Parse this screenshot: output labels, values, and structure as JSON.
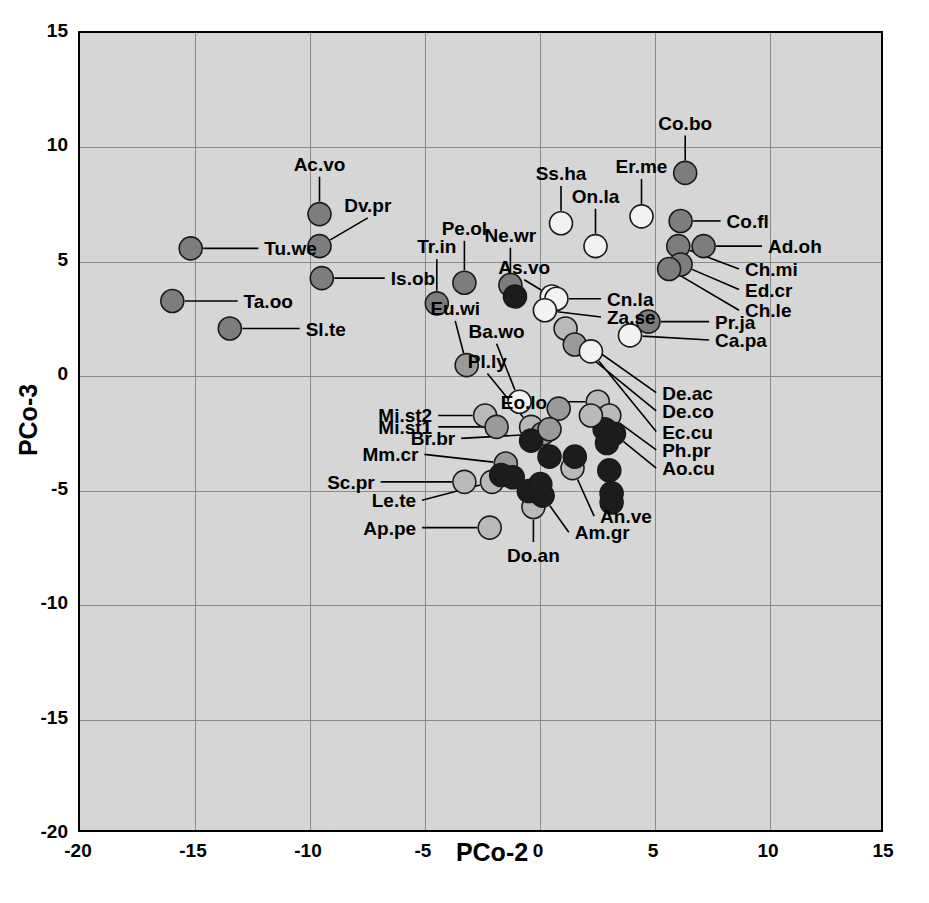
{
  "chart_data": {
    "type": "scatter",
    "title": "",
    "xlabel": "PCo-2",
    "ylabel": "PCo-3",
    "xlim": [
      -20,
      15
    ],
    "ylim": [
      -20,
      15
    ],
    "xticks": [
      -20,
      -15,
      -10,
      -5,
      0,
      5,
      10,
      15
    ],
    "yticks": [
      -20,
      -15,
      -10,
      -5,
      0,
      5,
      10,
      15
    ],
    "xtick_labels": [
      "-20",
      "-15",
      "-10",
      "-5",
      "0",
      "5",
      "10",
      "15"
    ],
    "ytick_labels": [
      "-20",
      "-15",
      "-10",
      "-5",
      "0",
      "5",
      "10",
      "15"
    ],
    "grid": true,
    "legend": "none",
    "plot_background": "#d6d6d6",
    "grid_color": "#8a8a8a",
    "marker_fills": {
      "open": "#f2f2f2",
      "light": "#b9b9b9",
      "mid": "#9a9a9a",
      "gray": "#7d7d7d",
      "dark": "#1c1c1c"
    },
    "points": [
      {
        "label": "Tu.we",
        "x": -15.1,
        "y": 5.5,
        "fill": "gray",
        "label_x": -11.9,
        "label_y": 5.5,
        "anchor": "start",
        "leader": true
      },
      {
        "label": "Ta.oo",
        "x": -15.9,
        "y": 3.2,
        "fill": "gray",
        "label_x": -12.8,
        "label_y": 3.2,
        "anchor": "start",
        "leader": true
      },
      {
        "label": "Sl.te",
        "x": -13.4,
        "y": 2.0,
        "fill": "gray",
        "label_x": -10.1,
        "label_y": 2.0,
        "anchor": "start",
        "leader": true
      },
      {
        "label": "Ac.vo",
        "x": -9.5,
        "y": 7.0,
        "fill": "gray",
        "label_x": -9.5,
        "label_y": 9.2,
        "anchor": "mid",
        "leader": true
      },
      {
        "label": "Dv.pr",
        "x": -9.5,
        "y": 5.6,
        "fill": "gray",
        "label_x": -7.4,
        "label_y": 7.4,
        "anchor": "mid",
        "leader": true
      },
      {
        "label": "Is.ob",
        "x": -9.4,
        "y": 4.2,
        "fill": "gray",
        "label_x": -6.4,
        "label_y": 4.2,
        "anchor": "start",
        "leader": true
      },
      {
        "label": "Tr.in",
        "x": -4.4,
        "y": 3.1,
        "fill": "gray",
        "label_x": -4.4,
        "label_y": 5.6,
        "anchor": "mid",
        "leader": true
      },
      {
        "label": "Pe.ol",
        "x": -3.2,
        "y": 4.0,
        "fill": "gray",
        "label_x": -3.2,
        "label_y": 6.4,
        "anchor": "mid",
        "leader": true
      },
      {
        "label": "Eu.wi",
        "x": -3.1,
        "y": 0.4,
        "fill": "mid",
        "label_x": -3.6,
        "label_y": 2.9,
        "anchor": "mid",
        "leader": true
      },
      {
        "label": "Ne.wr",
        "x": -1.2,
        "y": 3.9,
        "fill": "gray",
        "label_x": -1.2,
        "label_y": 6.1,
        "anchor": "mid",
        "leader": true
      },
      {
        "label": "Ne.wr2",
        "x": -1.0,
        "y": 3.4,
        "fill": "dark",
        "label_x": null,
        "label_y": null,
        "anchor": "mid",
        "leader": false
      },
      {
        "label": "Ss.ha",
        "x": 1.0,
        "y": 6.6,
        "fill": "open",
        "label_x": 1.0,
        "label_y": 8.8,
        "anchor": "mid",
        "leader": true
      },
      {
        "label": "On.la",
        "x": 2.5,
        "y": 5.6,
        "fill": "open",
        "label_x": 2.5,
        "label_y": 7.8,
        "anchor": "mid",
        "leader": true
      },
      {
        "label": "Er.me",
        "x": 4.5,
        "y": 6.9,
        "fill": "open",
        "label_x": 4.5,
        "label_y": 9.1,
        "anchor": "mid",
        "leader": true
      },
      {
        "label": "Co.bo",
        "x": 6.4,
        "y": 8.8,
        "fill": "gray",
        "label_x": 6.4,
        "label_y": 11.0,
        "anchor": "mid",
        "leader": true
      },
      {
        "label": "Co.fl",
        "x": 6.2,
        "y": 6.7,
        "fill": "gray",
        "label_x": 8.2,
        "label_y": 6.7,
        "anchor": "start",
        "leader": true
      },
      {
        "label": "Ad.oh",
        "x": 7.2,
        "y": 5.6,
        "fill": "gray",
        "label_x": 10.0,
        "label_y": 5.6,
        "anchor": "start",
        "leader": true
      },
      {
        "label": "Ch.mi",
        "x": 6.1,
        "y": 5.6,
        "fill": "gray",
        "label_x": 9.0,
        "label_y": 4.6,
        "anchor": "start",
        "leader": true
      },
      {
        "label": "Ed.cr",
        "x": 6.2,
        "y": 4.8,
        "fill": "gray",
        "label_x": 9.0,
        "label_y": 3.7,
        "anchor": "start",
        "leader": true
      },
      {
        "label": "Ch.le",
        "x": 5.7,
        "y": 4.6,
        "fill": "gray",
        "label_x": 9.0,
        "label_y": 2.8,
        "anchor": "start",
        "leader": true
      },
      {
        "label": "As.vo",
        "x": 0.6,
        "y": 3.4,
        "fill": "open",
        "label_x": -0.6,
        "label_y": 4.7,
        "anchor": "mid",
        "leader": true
      },
      {
        "label": "Cn.la",
        "x": 0.8,
        "y": 3.3,
        "fill": "open",
        "label_x": 3.0,
        "label_y": 3.3,
        "anchor": "start",
        "leader": true
      },
      {
        "label": "Za.se",
        "x": 0.3,
        "y": 2.8,
        "fill": "open",
        "label_x": 3.0,
        "label_y": 2.5,
        "anchor": "start",
        "leader": true
      },
      {
        "label": "Pr.ja",
        "x": 4.8,
        "y": 2.3,
        "fill": "gray",
        "label_x": 7.7,
        "label_y": 2.3,
        "anchor": "start",
        "leader": true
      },
      {
        "label": "Ca.pa",
        "x": 4.0,
        "y": 1.7,
        "fill": "open",
        "label_x": 7.7,
        "label_y": 1.5,
        "anchor": "start",
        "leader": true
      },
      {
        "label": "Ba.wo",
        "x": -0.8,
        "y": -1.2,
        "fill": "open",
        "label_x": -1.8,
        "label_y": 1.9,
        "anchor": "mid",
        "leader": true
      },
      {
        "label": "Pl.ly",
        "x": -0.3,
        "y": -2.3,
        "fill": "light",
        "label_x": -2.2,
        "label_y": 0.6,
        "anchor": "mid",
        "leader": true
      },
      {
        "label": "De.ac",
        "x": 1.2,
        "y": 2.0,
        "fill": "light",
        "label_x": 5.4,
        "label_y": -0.8,
        "anchor": "start",
        "leader": true
      },
      {
        "label": "De.co",
        "x": 1.6,
        "y": 1.3,
        "fill": "mid",
        "label_x": 5.4,
        "label_y": -1.6,
        "anchor": "start",
        "leader": true
      },
      {
        "label": "Ec.cu",
        "x": 2.3,
        "y": 1.0,
        "fill": "open",
        "label_x": 5.4,
        "label_y": -2.5,
        "anchor": "start",
        "leader": true
      },
      {
        "label": "Eo.lo",
        "x": 2.6,
        "y": -1.2,
        "fill": "light",
        "label_x": 0.4,
        "label_y": -1.2,
        "anchor": "end",
        "leader": true
      },
      {
        "label": "Ph.pr",
        "x": 3.1,
        "y": -1.8,
        "fill": "light",
        "label_x": 5.4,
        "label_y": -3.3,
        "anchor": "start",
        "leader": true
      },
      {
        "label": "Ao.cu",
        "x": 3.3,
        "y": -2.6,
        "fill": "dark",
        "label_x": 5.4,
        "label_y": -4.1,
        "anchor": "start",
        "leader": true
      },
      {
        "label": "Mi.st2",
        "x": -2.3,
        "y": -1.8,
        "fill": "light",
        "label_x": -4.6,
        "label_y": -1.8,
        "anchor": "end",
        "leader": true
      },
      {
        "label": "Mi.st1",
        "x": -1.8,
        "y": -2.3,
        "fill": "mid",
        "label_x": -4.6,
        "label_y": -2.3,
        "anchor": "end",
        "leader": true
      },
      {
        "label": "Br.br",
        "x": 0.2,
        "y": -2.6,
        "fill": "mid",
        "label_x": -3.6,
        "label_y": -2.8,
        "anchor": "end",
        "leader": true
      },
      {
        "label": "Mm.cr",
        "x": -1.4,
        "y": -3.9,
        "fill": "mid",
        "label_x": -5.2,
        "label_y": -3.5,
        "anchor": "end",
        "leader": true
      },
      {
        "label": "Sc.pr",
        "x": -3.2,
        "y": -4.7,
        "fill": "light",
        "label_x": -7.1,
        "label_y": -4.7,
        "anchor": "end",
        "leader": true
      },
      {
        "label": "Le.te",
        "x": -2.0,
        "y": -4.7,
        "fill": "light",
        "label_x": -5.3,
        "label_y": -5.5,
        "anchor": "end",
        "leader": true
      },
      {
        "label": "Ap.pe",
        "x": -2.1,
        "y": -6.7,
        "fill": "light",
        "label_x": -5.3,
        "label_y": -6.7,
        "anchor": "end",
        "leader": true
      },
      {
        "label": "Do.an",
        "x": -0.2,
        "y": -5.8,
        "fill": "light",
        "label_x": -0.2,
        "label_y": -7.9,
        "anchor": "mid",
        "leader": true
      },
      {
        "label": "Am.gr",
        "x": 0.2,
        "y": -5.3,
        "fill": "dark",
        "label_x": 1.6,
        "label_y": -6.9,
        "anchor": "start",
        "leader": true
      },
      {
        "label": "An.ve",
        "x": 1.5,
        "y": -4.1,
        "fill": "light",
        "label_x": 2.7,
        "label_y": -6.2,
        "anchor": "start",
        "leader": true
      },
      {
        "label": "p01",
        "x": -0.3,
        "y": -2.9,
        "fill": "dark",
        "label_x": null,
        "label_y": null,
        "anchor": "mid",
        "leader": false
      },
      {
        "label": "p02",
        "x": -1.6,
        "y": -4.4,
        "fill": "dark",
        "label_x": null,
        "label_y": null,
        "anchor": "mid",
        "leader": false
      },
      {
        "label": "p03",
        "x": -1.1,
        "y": -4.5,
        "fill": "dark",
        "label_x": null,
        "label_y": null,
        "anchor": "mid",
        "leader": false
      },
      {
        "label": "p04",
        "x": 0.5,
        "y": -3.6,
        "fill": "dark",
        "label_x": null,
        "label_y": null,
        "anchor": "mid",
        "leader": false
      },
      {
        "label": "p05",
        "x": 1.6,
        "y": -3.6,
        "fill": "dark",
        "label_x": null,
        "label_y": null,
        "anchor": "mid",
        "leader": false
      },
      {
        "label": "p06",
        "x": -0.4,
        "y": -5.1,
        "fill": "dark",
        "label_x": null,
        "label_y": null,
        "anchor": "mid",
        "leader": false
      },
      {
        "label": "p07",
        "x": 0.1,
        "y": -4.8,
        "fill": "dark",
        "label_x": null,
        "label_y": null,
        "anchor": "mid",
        "leader": false
      },
      {
        "label": "p08",
        "x": 2.9,
        "y": -2.4,
        "fill": "dark",
        "label_x": null,
        "label_y": null,
        "anchor": "mid",
        "leader": false
      },
      {
        "label": "p09",
        "x": 3.0,
        "y": -3.0,
        "fill": "dark",
        "label_x": null,
        "label_y": null,
        "anchor": "mid",
        "leader": false
      },
      {
        "label": "p10",
        "x": 3.1,
        "y": -4.2,
        "fill": "dark",
        "label_x": null,
        "label_y": null,
        "anchor": "mid",
        "leader": false
      },
      {
        "label": "p11",
        "x": 3.2,
        "y": -5.2,
        "fill": "dark",
        "label_x": null,
        "label_y": null,
        "anchor": "mid",
        "leader": false
      },
      {
        "label": "p12",
        "x": 3.2,
        "y": -5.6,
        "fill": "dark",
        "label_x": null,
        "label_y": null,
        "anchor": "mid",
        "leader": false
      },
      {
        "label": "p13",
        "x": 2.3,
        "y": -1.8,
        "fill": "light",
        "label_x": null,
        "label_y": null,
        "anchor": "mid",
        "leader": false
      },
      {
        "label": "p14",
        "x": 0.9,
        "y": -1.5,
        "fill": "mid",
        "label_x": null,
        "label_y": null,
        "anchor": "mid",
        "leader": false
      },
      {
        "label": "p15",
        "x": 0.5,
        "y": -2.4,
        "fill": "mid",
        "label_x": null,
        "label_y": null,
        "anchor": "mid",
        "leader": false
      }
    ]
  }
}
